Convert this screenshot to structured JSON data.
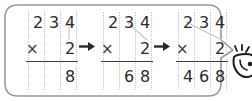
{
  "figure": {
    "frame_shape": "rounded-speech-bubble",
    "frame_color": "#9a9a9a",
    "digit_color": "#2b2b2b",
    "guide_color": "#c9c9c9",
    "rule_color": "#3c3c3c",
    "arrow_color": "#2a2a2a"
  },
  "steps": [
    {
      "id": "step-1",
      "multiplicand": [
        "2",
        "3",
        "4"
      ],
      "operator": "×",
      "multiplier": [
        "",
        "",
        "2"
      ],
      "result": [
        "",
        "",
        "8"
      ],
      "highlight": "ones-column",
      "carry_mark": "up-arrow-from-2-to-4"
    },
    {
      "id": "step-2",
      "multiplicand": [
        "2",
        "3",
        "4"
      ],
      "operator": "×",
      "multiplier": [
        "",
        "",
        "2"
      ],
      "result": [
        "",
        "6",
        "8"
      ],
      "highlight": "tens-column",
      "carry_mark": "diagonal-from-2-to-3"
    },
    {
      "id": "step-3",
      "multiplicand": [
        "2",
        "3",
        "4"
      ],
      "operator": "×",
      "multiplier": [
        "",
        "",
        "2"
      ],
      "result": [
        "4",
        "6",
        "8"
      ],
      "highlight": "hundreds-column",
      "carry_mark": "diagonal-from-2-to-2"
    }
  ],
  "connectors": [
    {
      "id": "arrow-1",
      "glyph": "→",
      "from": "step-1",
      "to": "step-2"
    },
    {
      "id": "arrow-2",
      "glyph": "→",
      "from": "step-2",
      "to": "step-3"
    }
  ],
  "decorations": [
    {
      "id": "pointer-icon",
      "name": "hand-pointer-icon",
      "state": "cropped-at-right-edge"
    }
  ]
}
